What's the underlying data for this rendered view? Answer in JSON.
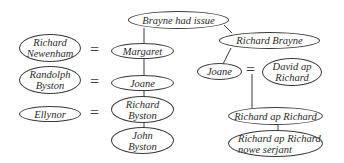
{
  "diagram": {
    "type": "family-tree",
    "nodes": {
      "brayne_had_issue": "Brayne had issue",
      "richard_brayne": "Richard Brayne",
      "richard_newenham": "Richard\nNewenham",
      "margaret": "Margaret",
      "randolph_byston": "Randolph\nByston",
      "joane_left": "Joane",
      "ellynor": "Ellynor",
      "richard_byston": "Richard\nByston",
      "john_byston": "John\nByston",
      "joane_right": "Joane",
      "david_ap_richard": "David ap\nRichard",
      "richard_ap_richard": "Richard ap Richard",
      "richard_ap_richard_serjant": "Richard ap Richard\nnowe serjant"
    },
    "marriage_symbol": "=",
    "relations": [
      {
        "type": "parent-child",
        "from": "Brayne had issue",
        "to": "Margaret"
      },
      {
        "type": "parent-child",
        "from": "Brayne had issue",
        "to": "Richard Brayne"
      },
      {
        "type": "marriage",
        "a": "Richard Newenham",
        "b": "Margaret"
      },
      {
        "type": "parent-child",
        "from": "Margaret",
        "to": "Joane"
      },
      {
        "type": "marriage",
        "a": "Randolph Byston",
        "b": "Joane"
      },
      {
        "type": "parent-child",
        "from": "Joane",
        "to": "Richard Byston"
      },
      {
        "type": "marriage",
        "a": "Ellynor",
        "b": "Richard Byston"
      },
      {
        "type": "parent-child",
        "from": "Richard Byston",
        "to": "John Byston"
      },
      {
        "type": "parent-child",
        "from": "Richard Brayne",
        "to": "Joane"
      },
      {
        "type": "marriage",
        "a": "Joane",
        "b": "David ap Richard"
      },
      {
        "type": "parent-child",
        "from": "Joane = David ap Richard",
        "to": "Richard ap Richard"
      },
      {
        "type": "parent-child",
        "from": "Richard ap Richard",
        "to": "Richard ap Richard nowe serjant"
      }
    ]
  }
}
